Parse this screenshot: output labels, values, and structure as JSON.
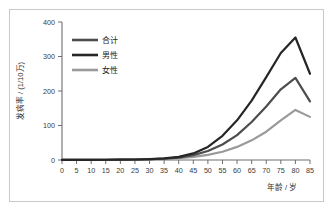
{
  "chart_data": {
    "type": "line",
    "title": "",
    "xlabel": "年龄 / 岁",
    "ylabel": "发病率 / (1/10万)",
    "xlim": [
      0,
      85
    ],
    "ylim": [
      0,
      400
    ],
    "x_ticks": [
      0,
      5,
      10,
      15,
      20,
      25,
      30,
      35,
      40,
      45,
      50,
      55,
      60,
      65,
      70,
      75,
      80,
      85
    ],
    "y_ticks": [
      0,
      100,
      200,
      300,
      400
    ],
    "grid": false,
    "legend_position": "top-left",
    "x": [
      0,
      5,
      10,
      15,
      20,
      25,
      30,
      35,
      40,
      45,
      50,
      55,
      60,
      65,
      70,
      75,
      80,
      85
    ],
    "series": [
      {
        "name": "合计",
        "color": "#4d4d4d",
        "values": [
          0.4,
          0.4,
          0.5,
          0.6,
          0.9,
          1.3,
          2.2,
          3.8,
          7.0,
          14.0,
          26.0,
          45.0,
          72.0,
          110.0,
          155.0,
          205.0,
          238.0,
          170.0
        ]
      },
      {
        "name": "男性",
        "color": "#262626",
        "values": [
          0.4,
          0.4,
          0.5,
          0.7,
          1.0,
          1.5,
          2.6,
          4.6,
          9.0,
          19.0,
          38.0,
          70.0,
          115.0,
          172.0,
          240.0,
          310.0,
          355.0,
          250.0
        ]
      },
      {
        "name": "女性",
        "color": "#9a9a9a",
        "values": [
          0.4,
          0.4,
          0.4,
          0.5,
          0.8,
          1.1,
          1.8,
          3.0,
          5.2,
          9.0,
          15.0,
          24.0,
          38.0,
          57.0,
          82.0,
          115.0,
          145.0,
          125.0
        ]
      }
    ]
  },
  "legend": {
    "items": [
      {
        "label": "合计"
      },
      {
        "label": "男性"
      },
      {
        "label": "女性"
      }
    ]
  },
  "axes": {
    "y_title": "发病率 / (1/10万)",
    "x_title": "年龄 / 岁"
  }
}
